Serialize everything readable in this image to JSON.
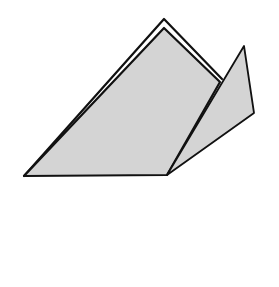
{
  "diagram": {
    "type": "origami-fold-step",
    "colors": {
      "paper_fill": "#d4d4d4",
      "outline": "#111111",
      "background": "#ffffff"
    },
    "shapes": {
      "main_body": {
        "points": "24,176 164,28 220,82 167,175"
      },
      "back_layer_edge": {
        "points": "24,176 164,19 222,79"
      },
      "right_flap": {
        "points": "167,175 244,46 254,113"
      }
    }
  }
}
